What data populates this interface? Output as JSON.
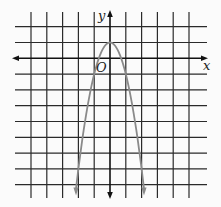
{
  "chart_data": {
    "type": "line",
    "title": "",
    "xlabel": "x",
    "ylabel": "y",
    "origin_label": "O",
    "function": "y = 1 - 2x^2",
    "vertex": [
      0,
      1
    ],
    "xlim": [
      -5,
      6
    ],
    "ylim": [
      -8.5,
      3
    ],
    "grid": true,
    "grid_unit": 1,
    "series": [
      {
        "name": "parabola",
        "color": "#8a8a8a",
        "x": [
          -2.15,
          -2,
          -1.5,
          -1,
          -0.5,
          0,
          0.5,
          1,
          1.5,
          2,
          2.15
        ],
        "y": [
          -8.25,
          -7,
          -3.5,
          -1,
          0.5,
          1,
          0.5,
          -1,
          -3.5,
          -7,
          -8.25
        ],
        "arrows_at_ends": true
      }
    ]
  },
  "colors": {
    "background": "#fbfbfb",
    "grid": "#2a2a2a",
    "axis": "#111111",
    "curve": "#8a8a8a"
  }
}
